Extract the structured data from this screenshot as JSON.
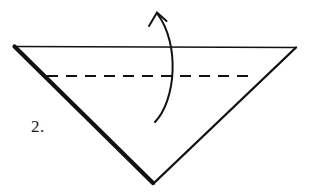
{
  "figure": {
    "step_label": "2.",
    "background_color": "#ffffff",
    "ink_color": "#111111",
    "shape": {
      "name": "inverted-triangle",
      "vertices": [
        {
          "name": "top-left",
          "x": 14,
          "y": 46
        },
        {
          "name": "top-right",
          "x": 296,
          "y": 47
        },
        {
          "name": "bottom-apex",
          "x": 153,
          "y": 183
        }
      ],
      "edges": [
        {
          "name": "top-edge",
          "from": "top-left",
          "to": "top-right",
          "weight": "thin",
          "stroke_width": 1.3
        },
        {
          "name": "left-edge",
          "from": "top-left",
          "to": "bottom-apex",
          "weight": "bold",
          "stroke_width": 4.2
        },
        {
          "name": "left-edge-inner",
          "from": "top-left",
          "to": "bottom-apex",
          "weight": "hairline",
          "stroke_width": 0.9
        },
        {
          "name": "right-edge",
          "from": "top-right",
          "to": "bottom-apex",
          "weight": "medium",
          "stroke_width": 2.4
        }
      ]
    },
    "fold_line": {
      "name": "valley-fold-dashed-line",
      "style": "dashed",
      "x1": 47,
      "y1": 76,
      "x2": 256,
      "y2": 76,
      "dash_pattern": "11 8",
      "stroke_width": 2.1
    },
    "fold_arrow": {
      "name": "curved-fold-arrow",
      "direction": "upward",
      "tail": {
        "x": 155,
        "y": 122
      },
      "control": {
        "x": 179,
        "y": 66
      },
      "head": {
        "x": 157,
        "y": 13
      },
      "arrowhead_style": "open-v",
      "stroke_width": 2.0
    }
  }
}
